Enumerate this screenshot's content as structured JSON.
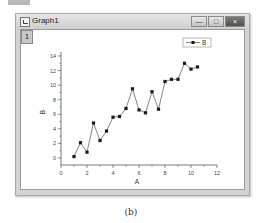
{
  "window": {
    "title": "Graph1",
    "layer_label": "1",
    "controls": {
      "minimize": "—",
      "maximize": "□",
      "close": "×"
    }
  },
  "caption": "(b)",
  "chart_data": {
    "type": "line",
    "title": "",
    "xlabel": "A",
    "ylabel": "B",
    "xlim": [
      0,
      12
    ],
    "ylim": [
      0,
      14
    ],
    "x_ticks": [
      0,
      2,
      4,
      6,
      8,
      10,
      12
    ],
    "y_ticks": [
      0,
      2,
      4,
      6,
      8,
      10,
      12,
      14
    ],
    "grid": false,
    "legend": {
      "position": "top-right",
      "entries": [
        "B"
      ]
    },
    "series": [
      {
        "name": "B",
        "marker": "square",
        "color": "#1a1a1a",
        "x": [
          1.0,
          1.5,
          2.0,
          2.5,
          3.0,
          3.5,
          4.0,
          4.5,
          5.0,
          5.5,
          6.0,
          6.5,
          7.0,
          7.5,
          8.0,
          8.5,
          9.0,
          9.5,
          10.0,
          10.5
        ],
        "y": [
          0.2,
          2.1,
          0.8,
          4.8,
          2.4,
          3.7,
          5.6,
          5.7,
          6.8,
          9.5,
          6.6,
          6.2,
          9.1,
          6.7,
          10.5,
          10.8,
          10.8,
          13.0,
          12.2,
          12.5
        ]
      }
    ]
  },
  "colors": {
    "titlebar": "#d9d9d9",
    "axis": "#555555",
    "line": "#666666",
    "marker": "#1a1a1a"
  }
}
